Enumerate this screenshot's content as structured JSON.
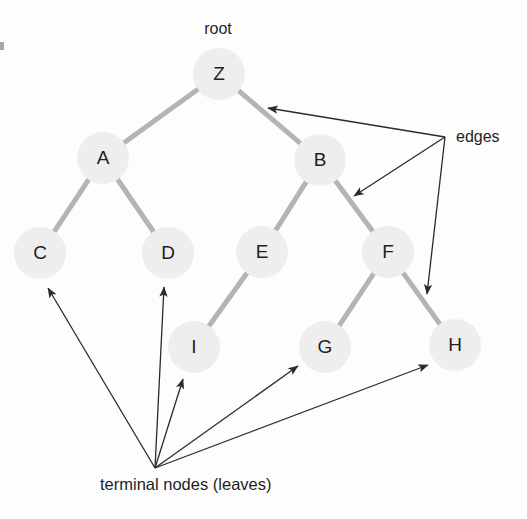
{
  "diagram": {
    "type": "tree-diagram",
    "canvas": {
      "width": 527,
      "height": 519,
      "background": "#fdfdfd"
    },
    "style": {
      "node_fill": "#eeeeee",
      "node_radius": 26,
      "node_label_color": "#1f1f1f",
      "tree_edge_color": "#b4b4b4",
      "tree_edge_width": 5,
      "annotation_color": "#2b2b2b",
      "annotation_width": 1.3
    },
    "nodes": [
      {
        "id": "Z",
        "label": "Z",
        "x": 219,
        "y": 74,
        "level": 0,
        "role": "root"
      },
      {
        "id": "A",
        "label": "A",
        "x": 103,
        "y": 158,
        "level": 1,
        "role": "internal"
      },
      {
        "id": "B",
        "label": "B",
        "x": 320,
        "y": 160,
        "level": 1,
        "role": "internal"
      },
      {
        "id": "C",
        "label": "C",
        "x": 40,
        "y": 253,
        "level": 2,
        "role": "leaf"
      },
      {
        "id": "D",
        "label": "D",
        "x": 168,
        "y": 253,
        "level": 2,
        "role": "leaf"
      },
      {
        "id": "E",
        "label": "E",
        "x": 262,
        "y": 252,
        "level": 2,
        "role": "internal"
      },
      {
        "id": "F",
        "label": "F",
        "x": 388,
        "y": 252,
        "level": 2,
        "role": "internal"
      },
      {
        "id": "I",
        "label": "I",
        "x": 194,
        "y": 347,
        "level": 3,
        "role": "leaf"
      },
      {
        "id": "G",
        "label": "G",
        "x": 325,
        "y": 347,
        "level": 3,
        "role": "leaf"
      },
      {
        "id": "H",
        "label": "H",
        "x": 455,
        "y": 345,
        "level": 3,
        "role": "leaf"
      }
    ],
    "edges": [
      {
        "from": "Z",
        "to": "A"
      },
      {
        "from": "Z",
        "to": "B"
      },
      {
        "from": "A",
        "to": "C"
      },
      {
        "from": "A",
        "to": "D"
      },
      {
        "from": "B",
        "to": "E"
      },
      {
        "from": "B",
        "to": "F"
      },
      {
        "from": "E",
        "to": "I"
      },
      {
        "from": "F",
        "to": "G"
      },
      {
        "from": "F",
        "to": "H"
      }
    ],
    "labels": {
      "root": {
        "text": "root",
        "x": 218,
        "y": 28
      },
      "edges": {
        "text": "edges",
        "x": 456,
        "y": 136
      },
      "leaves": {
        "text": "terminal nodes (leaves)",
        "x": 100,
        "y": 490
      }
    },
    "annotations": {
      "edges_origin": {
        "x": 445,
        "y": 137
      },
      "edges_targets": [
        {
          "x": 268,
          "y": 108,
          "describes": "edge Z-B"
        },
        {
          "x": 354,
          "y": 196,
          "describes": "edge B-F"
        },
        {
          "x": 427,
          "y": 294,
          "describes": "edge F-H"
        }
      ],
      "leaves_origin": {
        "x": 155,
        "y": 468
      },
      "leaves_targets": [
        {
          "x": 48,
          "y": 288,
          "describes": "node C"
        },
        {
          "x": 164,
          "y": 287,
          "describes": "node D"
        },
        {
          "x": 183,
          "y": 379,
          "describes": "node I"
        },
        {
          "x": 298,
          "y": 366,
          "describes": "node G"
        },
        {
          "x": 428,
          "y": 365,
          "describes": "node H"
        }
      ]
    }
  }
}
